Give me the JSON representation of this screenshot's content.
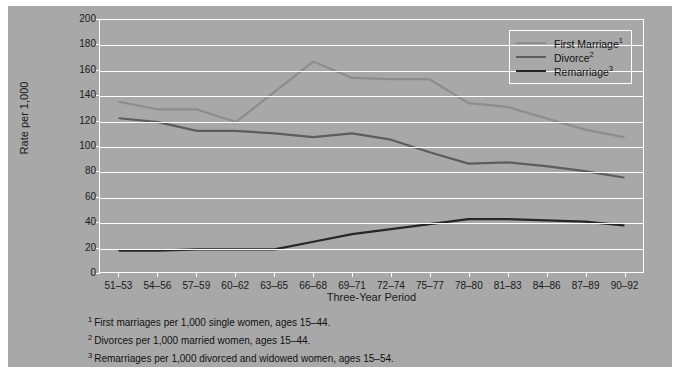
{
  "chart_data": {
    "type": "line",
    "title": "",
    "xlabel": "Three-Year Period",
    "ylabel": "Rate per 1,000",
    "ylim": [
      0,
      200
    ],
    "ytick_step": 20,
    "grid": true,
    "legend_position": "top-right",
    "categories": [
      "51–53",
      "54–56",
      "57–59",
      "60–62",
      "63–65",
      "66–68",
      "69–71",
      "72–74",
      "75–77",
      "78–80",
      "81–83",
      "84–86",
      "87–89",
      "90–92"
    ],
    "yticks": [
      "0",
      "20",
      "40",
      "60",
      "80",
      "100",
      "120",
      "140",
      "160",
      "180",
      "200"
    ],
    "series": [
      {
        "name": "First Marriage",
        "footnote_marker": "1",
        "color": "#8d8d8d",
        "values": [
          135,
          129,
          129,
          119,
          143,
          167,
          154,
          153,
          153,
          134,
          131,
          122,
          113,
          107
        ]
      },
      {
        "name": "Divorce",
        "footnote_marker": "2",
        "color": "#5d5d5d",
        "values": [
          122,
          119,
          112,
          112,
          110,
          107,
          110,
          105,
          95,
          86,
          87,
          84,
          80,
          75
        ]
      },
      {
        "name": "Remarriage",
        "footnote_marker": "3",
        "color": "#262626",
        "values": [
          17,
          17,
          18,
          18,
          18,
          24,
          30,
          34,
          38,
          42,
          42,
          41,
          40,
          37
        ]
      }
    ]
  },
  "legend": {
    "items": [
      {
        "label": "First Marriage",
        "marker": "1"
      },
      {
        "label": "Divorce",
        "marker": "2"
      },
      {
        "label": "Remarriage",
        "marker": "3"
      }
    ]
  },
  "footnotes": [
    {
      "marker": "1",
      "text": "First marriages per 1,000 single women, ages 15–44."
    },
    {
      "marker": "2",
      "text": "Divorces per 1,000 married women, ages 15–44."
    },
    {
      "marker": "3",
      "text": "Remarriages per 1,000 divorced and widowed women, ages 15–54."
    }
  ],
  "colors": {
    "background": "#a8a8a8",
    "page": "#ffffff",
    "grid": "#ffffff",
    "text": "#111111"
  }
}
